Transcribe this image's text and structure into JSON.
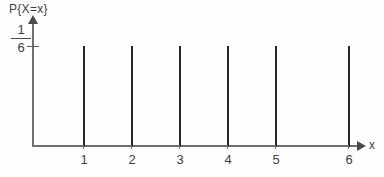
{
  "chart_data": {
    "type": "bar",
    "title": "",
    "subtitle": "",
    "ylabel": "P{X=x}",
    "xlabel": "x",
    "categories": [
      "1",
      "2",
      "3",
      "4",
      "5",
      "6"
    ],
    "values": [
      0.1667,
      0.1667,
      0.1667,
      0.1667,
      0.1667,
      0.1667
    ],
    "value_label": "1/6",
    "y_tick_labels": [
      "1/6"
    ],
    "y_tick_numerator": "1",
    "y_tick_denominator": "6",
    "ylim": [
      0,
      0.1667
    ],
    "xlim": [
      0,
      6.6
    ],
    "grid": false,
    "legend": null,
    "annotations": [],
    "axis_style": {
      "y_axis_arrow": true,
      "x_axis_arrow": true,
      "bar_color": "#262626",
      "axis_color": "#6e6e6e",
      "text_color": "#3f3f3f",
      "background": "#fdfdfd"
    }
  },
  "geometry": {
    "bar_x_positions": [
      83,
      131,
      179,
      227,
      275,
      348
    ],
    "bar_top": 46,
    "baseline": 147
  }
}
